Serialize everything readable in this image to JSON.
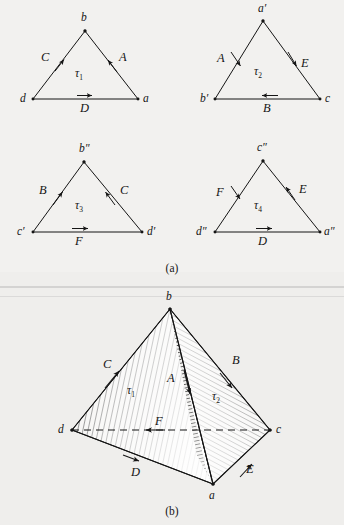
{
  "figure": {
    "panels": [
      {
        "id": "a",
        "caption": "(a)"
      },
      {
        "id": "b",
        "caption": "(b)"
      }
    ]
  },
  "panel_a": {
    "caption": "(a)",
    "triangles": [
      {
        "name": "tau1",
        "face_label": "τ",
        "face_subscript": "1",
        "vertices": [
          {
            "name": "apex",
            "label": "b"
          },
          {
            "name": "bottom-left",
            "label": "d"
          },
          {
            "name": "bottom-right",
            "label": "a"
          }
        ],
        "edges": [
          {
            "name": "left-edge",
            "label": "C",
            "direction": "up-right"
          },
          {
            "name": "right-edge",
            "label": "A",
            "direction": "up-left"
          },
          {
            "name": "bottom-edge",
            "label": "D",
            "direction": "right"
          }
        ]
      },
      {
        "name": "tau2",
        "face_label": "τ",
        "face_subscript": "2",
        "vertices": [
          {
            "name": "apex",
            "label": "a′"
          },
          {
            "name": "bottom-left",
            "label": "b′"
          },
          {
            "name": "bottom-right",
            "label": "c"
          }
        ],
        "edges": [
          {
            "name": "left-edge",
            "label": "A",
            "direction": "down-left"
          },
          {
            "name": "right-edge",
            "label": "E",
            "direction": "down-right"
          },
          {
            "name": "bottom-edge",
            "label": "B",
            "direction": "left"
          }
        ]
      },
      {
        "name": "tau3",
        "face_label": "τ",
        "face_subscript": "3",
        "vertices": [
          {
            "name": "apex",
            "label": "b″"
          },
          {
            "name": "bottom-left",
            "label": "c′"
          },
          {
            "name": "bottom-right",
            "label": "d′"
          }
        ],
        "edges": [
          {
            "name": "left-edge",
            "label": "B",
            "direction": "up-right"
          },
          {
            "name": "right-edge",
            "label": "C",
            "direction": "up-left"
          },
          {
            "name": "bottom-edge",
            "label": "F",
            "direction": "right"
          }
        ]
      },
      {
        "name": "tau4",
        "face_label": "τ",
        "face_subscript": "4",
        "vertices": [
          {
            "name": "apex",
            "label": "c″"
          },
          {
            "name": "bottom-left",
            "label": "d″"
          },
          {
            "name": "bottom-right",
            "label": "a″"
          }
        ],
        "edges": [
          {
            "name": "left-edge",
            "label": "F",
            "direction": "down-left"
          },
          {
            "name": "right-edge",
            "label": "E",
            "direction": "up-left"
          },
          {
            "name": "bottom-edge",
            "label": "D",
            "direction": "right"
          }
        ]
      }
    ]
  },
  "panel_b": {
    "caption": "(b)",
    "shape": "tetrahedron",
    "vertices": [
      {
        "name": "apex",
        "label": "b"
      },
      {
        "name": "left",
        "label": "d"
      },
      {
        "name": "right",
        "label": "c"
      },
      {
        "name": "front-bottom",
        "label": "a"
      }
    ],
    "edges": [
      {
        "name": "edge-d-b",
        "label": "C",
        "direction": "up-right"
      },
      {
        "name": "edge-b-c",
        "label": "B",
        "direction": "down-right"
      },
      {
        "name": "edge-b-a",
        "label": "A",
        "direction": "down"
      },
      {
        "name": "edge-d-c",
        "label": "F",
        "direction": "left"
      },
      {
        "name": "edge-d-a",
        "label": "D",
        "direction": "down-right"
      },
      {
        "name": "edge-a-c",
        "label": "E",
        "direction": "up-right"
      }
    ],
    "faces": [
      {
        "name": "face-tau1",
        "label": "τ",
        "subscript": "1"
      },
      {
        "name": "face-tau2",
        "label": "τ",
        "subscript": "2"
      }
    ]
  },
  "colors": {
    "ink": "#151515",
    "paper": "#f2f1ef",
    "paper_b": "#efeeec"
  }
}
